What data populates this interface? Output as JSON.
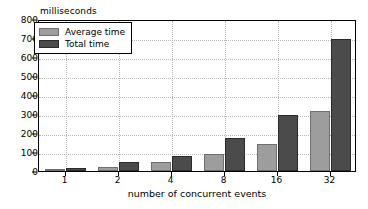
{
  "chart_data": {
    "type": "bar",
    "title": "",
    "subtitle": "",
    "unit_label": "milliseconds",
    "xlabel": "number of concurrent events",
    "ylabel": "",
    "categories": [
      "1",
      "2",
      "4",
      "8",
      "16",
      "32"
    ],
    "series": [
      {
        "name": "Average time",
        "color": "#9d9d9d",
        "values": [
          10,
          20,
          45,
          90,
          140,
          315
        ]
      },
      {
        "name": "Total time",
        "color": "#4b4b4b",
        "values": [
          15,
          45,
          80,
          175,
          295,
          695
        ]
      }
    ],
    "ylim": [
      0,
      800
    ],
    "yticks": [
      0,
      100,
      200,
      300,
      400,
      500,
      600,
      700,
      800
    ],
    "ytick_labels": [
      "0",
      "100",
      "200",
      "300",
      "400",
      "500",
      "600",
      "700",
      "800"
    ],
    "grid": true,
    "grid_style": "dotted",
    "legend_position": "upper left",
    "bar_edge_color": "#2f2f2f",
    "background_color": "#ffffff",
    "axis_color": "#000000"
  },
  "legend": {
    "entries": [
      {
        "label": "Average time"
      },
      {
        "label": "Total time"
      }
    ]
  }
}
